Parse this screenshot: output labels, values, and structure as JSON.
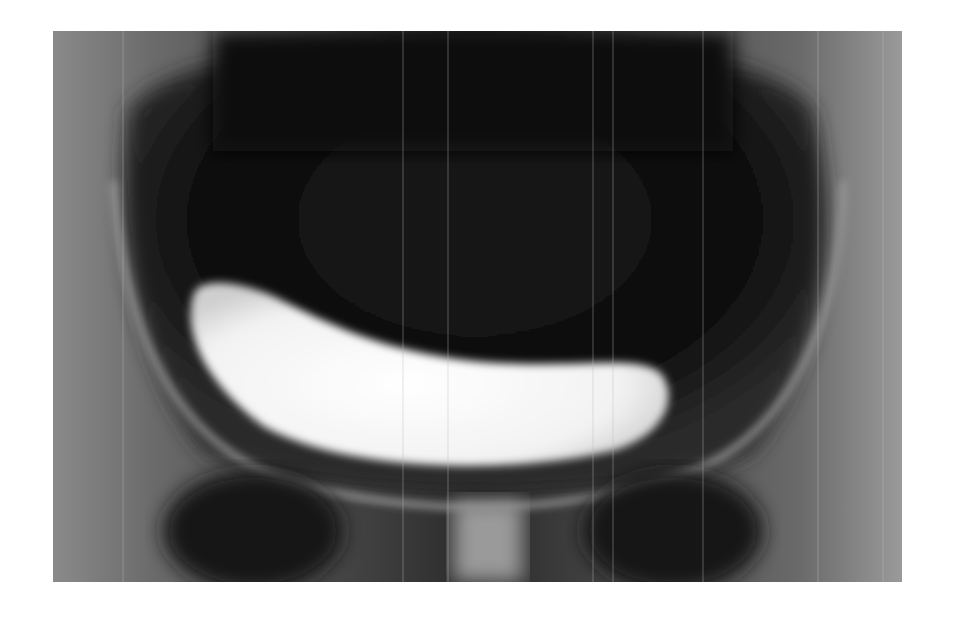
{
  "image": {
    "kind": "radiograph",
    "subject": "pelvic x-ray with contrast-filled bladder",
    "background": "#ffffff"
  }
}
